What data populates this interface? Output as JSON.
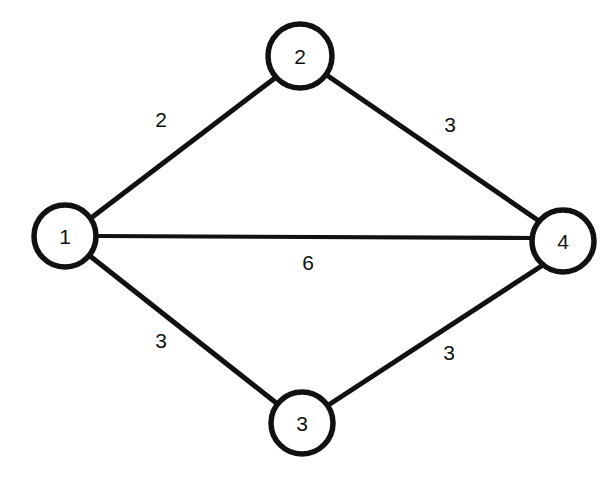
{
  "diagram": {
    "type": "weighted-undirected-graph",
    "background_color": "#ffffff",
    "stroke_color": "#111111",
    "nodes": [
      {
        "id": "1",
        "label": "1",
        "cx": 65,
        "cy": 236,
        "r": 31
      },
      {
        "id": "2",
        "label": "2",
        "cx": 300,
        "cy": 56,
        "r": 32
      },
      {
        "id": "3",
        "label": "3",
        "cx": 302,
        "cy": 423,
        "r": 31
      },
      {
        "id": "4",
        "label": "4",
        "cx": 563,
        "cy": 241,
        "r": 31
      }
    ],
    "edges": [
      {
        "id": "e12",
        "from": "1",
        "to": "2",
        "weight": "2",
        "x1": 91,
        "y1": 218,
        "x2": 275,
        "y2": 78,
        "label_x": 161,
        "label_y": 119
      },
      {
        "id": "e24",
        "from": "2",
        "to": "4",
        "weight": "3",
        "x1": 328,
        "y1": 76,
        "x2": 539,
        "y2": 221,
        "label_x": 450,
        "label_y": 124
      },
      {
        "id": "e14",
        "from": "1",
        "to": "4",
        "weight": "6",
        "x1": 95,
        "y1": 236,
        "x2": 532,
        "y2": 238,
        "label_x": 308,
        "label_y": 262
      },
      {
        "id": "e13",
        "from": "1",
        "to": "3",
        "weight": "3",
        "x1": 90,
        "y1": 256,
        "x2": 275,
        "y2": 402,
        "label_x": 161,
        "label_y": 340
      },
      {
        "id": "e34",
        "from": "3",
        "to": "4",
        "weight": "3",
        "x1": 330,
        "y1": 404,
        "x2": 543,
        "y2": 265,
        "label_x": 449,
        "label_y": 352
      }
    ]
  }
}
